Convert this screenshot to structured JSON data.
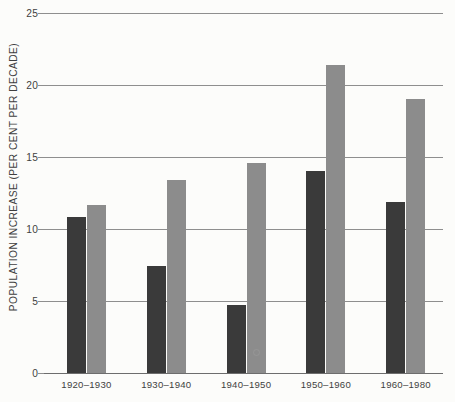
{
  "chart_data": {
    "type": "bar",
    "title": "",
    "subtitle": "",
    "xlabel": "",
    "ylabel": "POPULATION INCREASE (PER CENT PER DECADE)",
    "categories": [
      "1920–1930",
      "1930–1940",
      "1940–1950",
      "1950–1960",
      "1960–1980"
    ],
    "series": [
      {
        "name": "dark-series",
        "color": "#3a3a3a",
        "values": [
          10.8,
          7.4,
          4.7,
          14.0,
          11.9
        ]
      },
      {
        "name": "light-series",
        "color": "#8c8c8c",
        "values": [
          11.7,
          13.4,
          14.6,
          21.4,
          19.0
        ]
      }
    ],
    "ylim": [
      0,
      25
    ],
    "yticks": [
      0,
      5,
      10,
      15,
      20,
      25
    ],
    "ytick_labels": [
      "0",
      "5",
      "10",
      "15",
      "20",
      "25"
    ],
    "grid": true,
    "grid_axis": "y",
    "legend": false,
    "legend_position": "none"
  },
  "colors": {
    "background": "#fcfcfa",
    "grid": "#8e8e8e",
    "axis": "#6d6d6d",
    "text": "#3f3f3f",
    "series_dark": "#3a3a3a",
    "series_light": "#8c8c8c"
  }
}
